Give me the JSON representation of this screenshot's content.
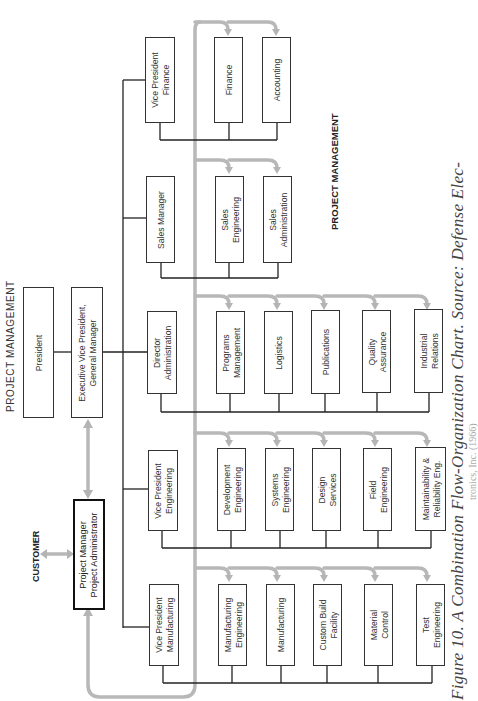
{
  "figure": {
    "caption": "Figure 10. A Combination Flow-Organization Chart. Source: Defense Elec-",
    "caption_line2": "tronics, Inc. (1966)",
    "left_label": "PROJECT MANAGEMENT",
    "right_label": "PROJECT MANAGEMENT",
    "customer_label": "CUSTOMER"
  },
  "colors": {
    "line": "#222222",
    "flow": "#b4b4b4",
    "box_border": "#333333",
    "background": "#ffffff"
  },
  "top": {
    "president": "President",
    "exec_vp": "Executive Vice President,\nGeneral Manager",
    "project_manager": "Project Manager\nProject Administrator"
  },
  "divisions": [
    {
      "head": "Vice President\nFinance",
      "departments": [
        "Finance",
        "Accounting"
      ]
    },
    {
      "head": "Sales Manager",
      "departments": [
        "Sales\nEngineering",
        "Sales\nAdministration"
      ]
    },
    {
      "head": "Director\nAdministration",
      "departments": [
        "Programs\nManagement",
        "Logistics",
        "Publications",
        "Quality\nAssurance",
        "Industrial\nRelations"
      ]
    },
    {
      "head": "Vice President\nEngineering",
      "departments": [
        "Development\nEngineering",
        "Systems\nEngineering",
        "Design\nServices",
        "Field\nEngineering",
        "Maintainability &\nReliability Eng."
      ]
    },
    {
      "head": "Vice President\nManufacturing",
      "departments": [
        "Manufacturing\nEngineering",
        "Manufacturing",
        "Custom Build\nFacility",
        "Material\nControl",
        "Test\nEngineering"
      ]
    }
  ]
}
